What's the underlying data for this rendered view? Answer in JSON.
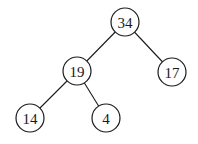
{
  "diagram": {
    "type": "binary-tree",
    "colors": {
      "stroke": "#1a1a1a",
      "node_fill": "#ffffff",
      "text": "#1a1a1a",
      "background": "#ffffff"
    },
    "node_radius": 14,
    "nodes": [
      {
        "id": "n34",
        "label": "34",
        "x": 125,
        "y": 22
      },
      {
        "id": "n19",
        "label": "19",
        "x": 77,
        "y": 71
      },
      {
        "id": "n17",
        "label": "17",
        "x": 172,
        "y": 72
      },
      {
        "id": "n14",
        "label": "14",
        "x": 30,
        "y": 118
      },
      {
        "id": "n4",
        "label": "4",
        "x": 106,
        "y": 118
      }
    ],
    "edges": [
      {
        "from": "n34",
        "to": "n19"
      },
      {
        "from": "n34",
        "to": "n17"
      },
      {
        "from": "n19",
        "to": "n14"
      },
      {
        "from": "n19",
        "to": "n4"
      }
    ]
  }
}
